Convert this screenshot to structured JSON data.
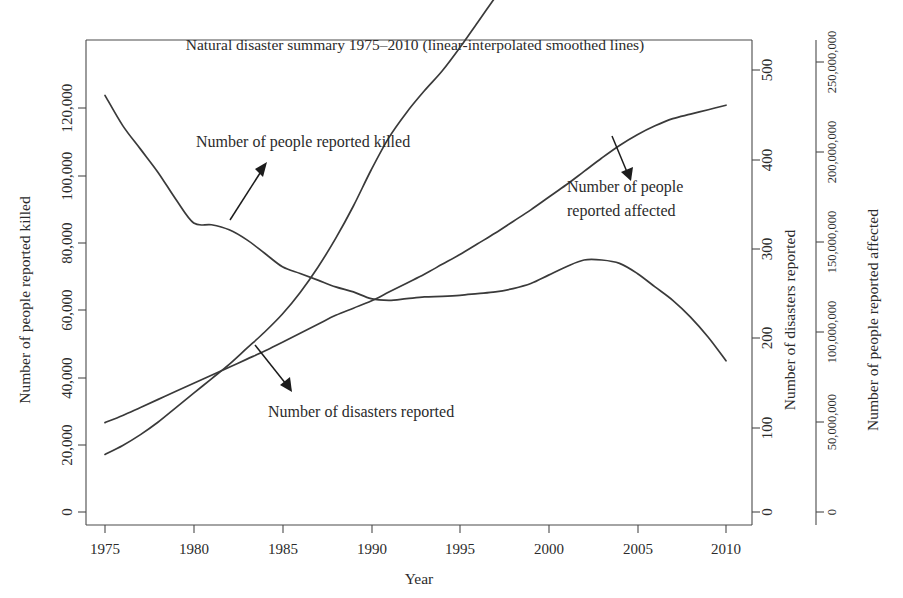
{
  "chart_data": {
    "type": "line",
    "title": "Natural disaster summary 1975–2010 (linear-interpolated smoothed lines)",
    "xlabel": "Year",
    "xlim": [
      1975,
      2010
    ],
    "xticks": [
      1975,
      1980,
      1985,
      1990,
      1995,
      2000,
      2005,
      2010
    ],
    "xtick_labels": [
      "1975",
      "1980",
      "1985",
      "1990",
      "1995",
      "2000",
      "2005",
      "2010"
    ],
    "grid": false,
    "legend": "annotations-with-arrows",
    "axes": [
      {
        "id": "killed",
        "position": "left",
        "label": "Number of people reported killed",
        "ylim": [
          0,
          130000
        ],
        "ticks": [
          0,
          20000,
          40000,
          60000,
          80000,
          100000,
          120000
        ],
        "tick_labels": [
          "0",
          "20,000",
          "40,000",
          "60,000",
          "80,000",
          "100,000",
          "120,000"
        ]
      },
      {
        "id": "disasters",
        "position": "right-inner",
        "label": "Number of disasters reported",
        "ylim": [
          0,
          540
        ],
        "ticks": [
          0,
          100,
          200,
          300,
          400,
          500
        ],
        "tick_labels": [
          "0",
          "100",
          "200",
          "300",
          "400",
          "500"
        ]
      },
      {
        "id": "affected",
        "position": "right-outer",
        "label": "Number of people reported affected",
        "ylim": [
          0,
          270000000
        ],
        "ticks": [
          0,
          50000000,
          100000000,
          150000000,
          200000000,
          250000000
        ],
        "tick_labels": [
          "0",
          "50,000,000",
          "100,000,000",
          "150,000,000",
          "200,000,000",
          "250,000,000"
        ]
      }
    ],
    "x": [
      1975,
      1976,
      1977,
      1978,
      1979,
      1980,
      1981,
      1982,
      1983,
      1984,
      1985,
      1986,
      1987,
      1988,
      1989,
      1990,
      1991,
      1992,
      1993,
      1994,
      1995,
      1996,
      1997,
      1998,
      1999,
      2000,
      2001,
      2002,
      2003,
      2004,
      2005,
      2006,
      2007,
      2008,
      2009,
      2010
    ],
    "series": [
      {
        "name": "Number of people reported killed",
        "axis": "killed",
        "units": "people",
        "values": [
          124000,
          115000,
          108000,
          101000,
          93000,
          86000,
          85500,
          84000,
          81000,
          77000,
          73000,
          71000,
          69000,
          67000,
          65500,
          63500,
          63000,
          63500,
          64000,
          64200,
          64500,
          65000,
          65500,
          66500,
          68000,
          70500,
          73000,
          75000,
          75000,
          74000,
          71000,
          67000,
          63000,
          58000,
          52000,
          45000
        ]
      },
      {
        "name": "Number of disasters reported",
        "axis": "disasters",
        "units": "disasters",
        "values": [
          100,
          108,
          117,
          126,
          135,
          144,
          153,
          162,
          171,
          180,
          190,
          200,
          210,
          220,
          228,
          236,
          246,
          256,
          266,
          277,
          288,
          300,
          312,
          325,
          338,
          352,
          366,
          381,
          396,
          410,
          422,
          432,
          440,
          445,
          450,
          455
        ]
      },
      {
        "name": "Number of people reported affected",
        "axis": "affected",
        "units": "people",
        "values": [
          32000000,
          37000000,
          43000000,
          50000000,
          58000000,
          66000000,
          74000000,
          82000000,
          91000000,
          100000000,
          110000000,
          122000000,
          136000000,
          152000000,
          170000000,
          190000000,
          208000000,
          222000000,
          234000000,
          245000000,
          258000000,
          272000000,
          286000000,
          300000000,
          314000000,
          330000000,
          350000000,
          372000000,
          388000000,
          392000000,
          390000000,
          385000000,
          378000000,
          370000000,
          362000000,
          355000000
        ]
      }
    ],
    "annotations": [
      {
        "id": "killed",
        "text_lines": [
          "Number of people reported killed"
        ],
        "text_x": 196,
        "text_y": 147,
        "arrow_from": [
          230,
          220
        ],
        "arrow_to": [
          267,
          164
        ]
      },
      {
        "id": "affected",
        "text_lines": [
          "Number of people",
          "reported affected"
        ],
        "text_x": 567,
        "text_y": 192,
        "arrow_from": [
          612,
          136
        ],
        "arrow_to": [
          630,
          180
        ]
      },
      {
        "id": "disasters",
        "text_lines": [
          "Number of disasters reported"
        ],
        "text_x": 268,
        "text_y": 417,
        "arrow_from": [
          255,
          345
        ],
        "arrow_to": [
          291,
          391
        ]
      }
    ]
  },
  "caption_fragment": "… (continued from previous page)"
}
